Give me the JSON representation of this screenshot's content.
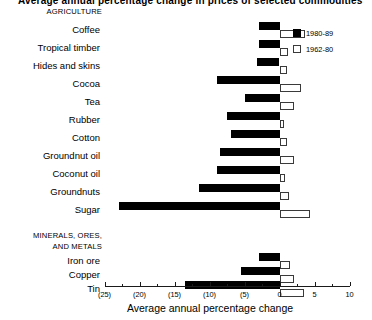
{
  "title": "Average annual percentage change in prices of selected commodities",
  "legend": {
    "position": "top-right",
    "items": [
      {
        "label": "1980-89",
        "style": "filled"
      },
      {
        "label": "1962-80",
        "style": "hollow"
      }
    ]
  },
  "axis": {
    "label": "Average annual percentage change",
    "ticks": [
      "(25)",
      "(20)",
      "(15)",
      "(10)",
      "(5)",
      "0",
      "5",
      "10"
    ],
    "tick_values": [
      -25,
      -20,
      -15,
      -10,
      -5,
      0,
      5,
      10
    ],
    "min": -25,
    "max": 10,
    "grid": false
  },
  "groups": [
    {
      "name": "AGRICULTURE"
    },
    {
      "name": "MINERALS, ORES,"
    },
    {
      "name": "AND METALS"
    }
  ],
  "chart_data": {
    "type": "bar",
    "orientation": "horizontal",
    "title": "Average annual percentage change in prices of selected commodities",
    "xlabel": "Average annual percentage change",
    "ylabel": "",
    "xlim": [
      -25,
      10
    ],
    "grid": false,
    "legend_position": "top-right",
    "group_labels": [
      "AGRICULTURE",
      "MINERALS, ORES, AND METALS"
    ],
    "categories": [
      "Coffee",
      "Tropical timber",
      "Hides and skins",
      "Cocoa",
      "Tea",
      "Rubber",
      "Cotton",
      "Groundnut oil",
      "Coconut oil",
      "Groundnuts",
      "Sugar",
      "Iron ore",
      "Copper",
      "Tin"
    ],
    "category_groups": [
      "AGRICULTURE",
      "AGRICULTURE",
      "AGRICULTURE",
      "AGRICULTURE",
      "AGRICULTURE",
      "AGRICULTURE",
      "AGRICULTURE",
      "AGRICULTURE",
      "AGRICULTURE",
      "AGRICULTURE",
      "AGRICULTURE",
      "MINERALS, ORES, AND METALS",
      "MINERALS, ORES, AND METALS",
      "MINERALS, ORES, AND METALS"
    ],
    "series": [
      {
        "name": "1980-89",
        "style": "filled",
        "values": [
          -3.0,
          -3.0,
          -3.2,
          -9.0,
          -5.0,
          -7.5,
          -7.0,
          -8.5,
          -9.0,
          -11.5,
          -23.0,
          -3.0,
          -5.5,
          -13.5
        ]
      },
      {
        "name": "1962-80",
        "style": "hollow",
        "values": [
          3.7,
          1.2,
          1.0,
          3.0,
          2.0,
          0.6,
          1.0,
          2.0,
          0.8,
          1.4,
          4.4,
          1.5,
          2.0,
          3.5
        ]
      }
    ]
  }
}
